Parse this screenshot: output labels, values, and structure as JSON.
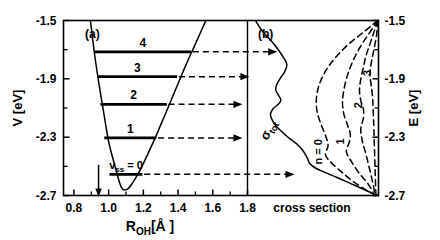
{
  "figure": {
    "panel_a_label": "(a)",
    "panel_b_label": "(b)",
    "left_axis_title": "V [eV]",
    "right_axis_title": "E [eV]",
    "x_axis_title_left": "R",
    "x_axis_title_sub": "OH",
    "x_axis_title_unit": "[Å ]",
    "x_axis_title_right": "cross section",
    "sigma_label_main": "σ",
    "sigma_label_sub": "tot",
    "v_label_main": "v",
    "v_label_sub": "ss",
    "v_label_eq": "= 0",
    "n_label": "n = 0"
  },
  "chart_data": {
    "type": "line",
    "title": "",
    "panels": [
      {
        "id": "a",
        "label": "(a)",
        "xlabel": "R_OH [Å]",
        "ylabel": "V [eV]",
        "xlim": [
          0.74,
          1.8
        ],
        "ylim": [
          -2.7,
          -1.5
        ],
        "xticks": [
          0.8,
          1.0,
          1.2,
          1.4,
          1.6,
          1.8
        ],
        "xtick_labels": [
          "0.8",
          "1.0",
          "1.2",
          "1.4",
          "1.6",
          "1.8"
        ],
        "yticks": [
          -1.5,
          -1.9,
          -2.3,
          -2.7
        ],
        "ytick_labels": [
          "-1.5",
          "-1.9",
          "-2.3",
          "-2.7"
        ],
        "yticks_minor": [
          -1.7,
          -2.1,
          -2.5
        ],
        "grid": false,
        "potential_curve": {
          "name": "OH stretch potential (Morse-like)",
          "r_min": 1.08,
          "v_min": -2.66,
          "points": [
            [
              0.895,
              -1.5
            ],
            [
              0.92,
              -1.74
            ],
            [
              0.945,
              -1.94
            ],
            [
              0.97,
              -2.12
            ],
            [
              1.0,
              -2.33
            ],
            [
              1.03,
              -2.47
            ],
            [
              1.06,
              -2.6
            ],
            [
              1.08,
              -2.655
            ],
            [
              1.11,
              -2.655
            ],
            [
              1.14,
              -2.61
            ],
            [
              1.18,
              -2.53
            ],
            [
              1.22,
              -2.43
            ],
            [
              1.27,
              -2.3
            ],
            [
              1.32,
              -2.16
            ],
            [
              1.38,
              -1.99
            ],
            [
              1.44,
              -1.82
            ],
            [
              1.5,
              -1.66
            ],
            [
              1.56,
              -1.5
            ]
          ]
        },
        "vibrational_levels": [
          {
            "v": 0,
            "label": "v_ss = 0",
            "energy": -2.555,
            "r_left": 1.005,
            "r_right": 1.195
          },
          {
            "v": 1,
            "label": "1",
            "energy": -2.305,
            "r_left": 0.975,
            "r_right": 1.275
          },
          {
            "v": 2,
            "label": "2",
            "energy": -2.075,
            "r_left": 0.953,
            "r_right": 1.335
          },
          {
            "v": 3,
            "label": "3",
            "energy": -1.885,
            "r_left": 0.935,
            "r_right": 1.395
          },
          {
            "v": 4,
            "label": "4",
            "energy": -1.715,
            "r_left": 0.918,
            "r_right": 1.475
          }
        ],
        "vertical_arrow": {
          "name": "equilibrium-geometry-arrow",
          "r": 0.942,
          "from_v": -2.49,
          "to_v": -2.7
        }
      },
      {
        "id": "b",
        "label": "(b)",
        "xlabel": "cross section",
        "ylabel": "E [eV]",
        "ylim": [
          -2.7,
          -1.5
        ],
        "yticks": [
          -1.5,
          -1.9,
          -2.3,
          -2.7
        ],
        "ytick_labels": [
          "-1.5",
          "-1.9",
          "-2.3",
          "-2.7"
        ],
        "yticks_minor": [
          -1.7,
          -2.1,
          -2.5
        ],
        "grid": false,
        "series": [
          {
            "name": "sigma_tot",
            "label": "σ_tot",
            "style": "solid",
            "points": [
              [
                0.06,
                -1.5
              ],
              [
                0.12,
                -1.58
              ],
              [
                0.2,
                -1.66
              ],
              [
                0.265,
                -1.74
              ],
              [
                0.3,
                -1.8
              ],
              [
                0.285,
                -1.85
              ],
              [
                0.255,
                -1.89
              ],
              [
                0.225,
                -1.935
              ],
              [
                0.215,
                -1.975
              ],
              [
                0.235,
                -2.01
              ],
              [
                0.255,
                -2.045
              ],
              [
                0.235,
                -2.075
              ],
              [
                0.195,
                -2.105
              ],
              [
                0.175,
                -2.145
              ],
              [
                0.19,
                -2.185
              ],
              [
                0.22,
                -2.225
              ],
              [
                0.265,
                -2.265
              ],
              [
                0.315,
                -2.305
              ],
              [
                0.375,
                -2.345
              ],
              [
                0.425,
                -2.395
              ],
              [
                0.455,
                -2.44
              ],
              [
                0.475,
                -2.48
              ],
              [
                0.525,
                -2.515
              ],
              [
                0.6,
                -2.545
              ],
              [
                0.68,
                -2.575
              ],
              [
                0.78,
                -2.615
              ],
              [
                0.88,
                -2.655
              ],
              [
                0.97,
                -2.69
              ],
              [
                1.0,
                -2.7
              ]
            ]
          },
          {
            "name": "partial_n0",
            "label": "n = 0",
            "style": "dashed",
            "points": [
              [
                0.995,
                -1.5
              ],
              [
                0.885,
                -1.58
              ],
              [
                0.775,
                -1.66
              ],
              [
                0.685,
                -1.74
              ],
              [
                0.615,
                -1.82
              ],
              [
                0.565,
                -1.9
              ],
              [
                0.535,
                -1.98
              ],
              [
                0.525,
                -2.06
              ],
              [
                0.535,
                -2.14
              ],
              [
                0.565,
                -2.22
              ],
              [
                0.6,
                -2.3
              ],
              [
                0.615,
                -2.36
              ],
              [
                0.595,
                -2.42
              ],
              [
                0.645,
                -2.48
              ],
              [
                0.72,
                -2.54
              ],
              [
                0.8,
                -2.6
              ],
              [
                0.9,
                -2.66
              ],
              [
                0.98,
                -2.7
              ]
            ]
          },
          {
            "name": "partial_n1",
            "label": "1",
            "style": "dashed",
            "points": [
              [
                0.995,
                -1.5
              ],
              [
                0.935,
                -1.58
              ],
              [
                0.875,
                -1.66
              ],
              [
                0.825,
                -1.74
              ],
              [
                0.785,
                -1.82
              ],
              [
                0.755,
                -1.9
              ],
              [
                0.735,
                -1.98
              ],
              [
                0.725,
                -2.06
              ],
              [
                0.735,
                -2.14
              ],
              [
                0.765,
                -2.22
              ],
              [
                0.785,
                -2.28
              ],
              [
                0.775,
                -2.34
              ],
              [
                0.755,
                -2.4
              ],
              [
                0.795,
                -2.47
              ],
              [
                0.855,
                -2.55
              ],
              [
                0.92,
                -2.62
              ],
              [
                0.975,
                -2.7
              ]
            ]
          },
          {
            "name": "partial_n2",
            "label": "2",
            "style": "dashed",
            "points": [
              [
                0.995,
                -1.5
              ],
              [
                0.965,
                -1.58
              ],
              [
                0.935,
                -1.66
              ],
              [
                0.905,
                -1.74
              ],
              [
                0.885,
                -1.82
              ],
              [
                0.865,
                -1.9
              ],
              [
                0.855,
                -1.98
              ],
              [
                0.865,
                -2.05
              ],
              [
                0.885,
                -2.11
              ],
              [
                0.885,
                -2.17
              ],
              [
                0.865,
                -2.24
              ],
              [
                0.875,
                -2.32
              ],
              [
                0.905,
                -2.42
              ],
              [
                0.935,
                -2.53
              ],
              [
                0.96,
                -2.63
              ],
              [
                0.975,
                -2.7
              ]
            ]
          },
          {
            "name": "partial_n3",
            "label": "3",
            "style": "dashed",
            "points": [
              [
                0.995,
                -1.5
              ],
              [
                0.985,
                -1.6
              ],
              [
                0.965,
                -1.7
              ],
              [
                0.945,
                -1.79
              ],
              [
                0.935,
                -1.87
              ],
              [
                0.945,
                -1.95
              ],
              [
                0.955,
                -2.03
              ],
              [
                0.96,
                -2.13
              ],
              [
                0.965,
                -2.25
              ],
              [
                0.97,
                -2.4
              ],
              [
                0.975,
                -2.55
              ],
              [
                0.98,
                -2.7
              ]
            ]
          }
        ],
        "partial_labels": [
          {
            "text": "n = 0",
            "x": 0.565,
            "y": -2.4,
            "rotation": -90
          },
          {
            "text": "1",
            "x": 0.735,
            "y": -2.33,
            "rotation": -90
          },
          {
            "text": "2",
            "x": 0.875,
            "y": -2.08,
            "rotation": -90
          },
          {
            "text": "3",
            "x": 0.945,
            "y": -1.86,
            "rotation": -90
          }
        ]
      }
    ],
    "transition_arrows": [
      {
        "from_level": 4,
        "energy": -1.715,
        "x_start": 1.485,
        "x_end": 1.965
      },
      {
        "from_level": 3,
        "energy": -1.885,
        "x_start": 1.405,
        "x_end": 1.805
      },
      {
        "from_level": 2,
        "energy": -2.075,
        "x_start": 1.345,
        "x_end": 1.765
      },
      {
        "from_level": 1,
        "energy": -2.305,
        "x_start": 1.285,
        "x_end": 1.765
      },
      {
        "from_level": 0,
        "energy": -2.555,
        "x_start": 1.205,
        "x_end": 2.065
      }
    ]
  },
  "colors": {
    "ink": "#000000",
    "background": "#ffffff"
  }
}
